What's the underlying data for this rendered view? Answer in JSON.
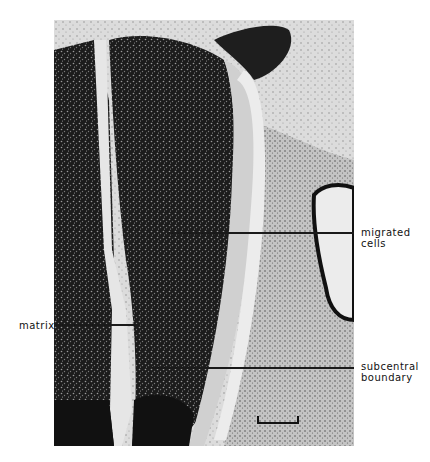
{
  "figure": {
    "labels": {
      "migrated_cells": "migrated\ncells",
      "matrix": "matrix",
      "subcentral_boundary": "subcentral\nboundary"
    },
    "scale_bar": {
      "label": ""
    },
    "colors": {
      "tissue_dark": "#141414",
      "tissue_mid": "#6a6a6a",
      "background_light": "#e2e2e2",
      "page": "#ffffff"
    }
  }
}
